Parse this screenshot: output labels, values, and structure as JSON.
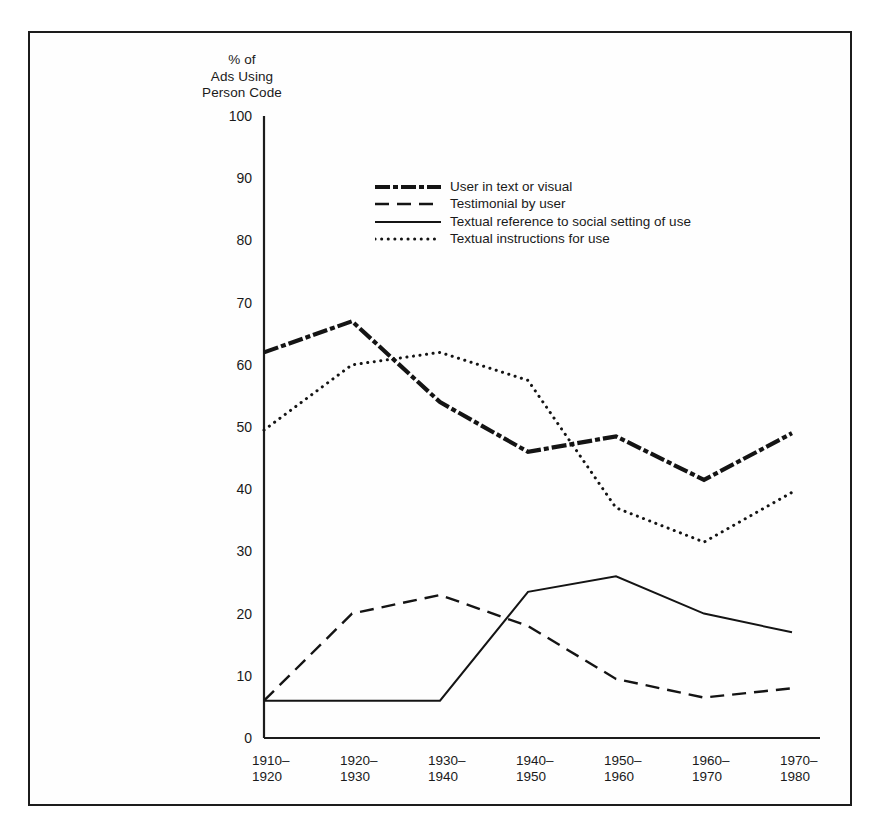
{
  "figure": {
    "y_axis_title": "% of\nAds Using\nPerson Code"
  },
  "legend": {
    "items": [
      {
        "label": "User in text or visual",
        "style": "thick-dash-dot"
      },
      {
        "label": "Testimonial by user",
        "style": "dashed"
      },
      {
        "label": "Textual reference to social setting of use",
        "style": "solid"
      },
      {
        "label": "Textual instructions for use",
        "style": "dotted"
      }
    ]
  },
  "chart_data": {
    "type": "line",
    "title": "",
    "xlabel": "",
    "ylabel": "% of Ads Using Person Code",
    "ylim": [
      0,
      100
    ],
    "ytick_values": [
      0,
      10,
      20,
      30,
      40,
      50,
      60,
      70,
      80,
      90,
      100
    ],
    "ytick_labels": [
      "0",
      "10",
      "20",
      "30",
      "40",
      "50",
      "60",
      "70",
      "80",
      "90",
      "100"
    ],
    "grid": false,
    "legend_position": "upper-center",
    "categories": [
      "1910-1920",
      "1920-1930",
      "1930-1940",
      "1940-1950",
      "1950-1960",
      "1960-1970",
      "1970-1980"
    ],
    "xtick_labels": [
      "1910–\n1920",
      "1920–\n1930",
      "1930–\n1940",
      "1940–\n1950",
      "1950–\n1960",
      "1960–\n1970",
      "1970–\n1980"
    ],
    "series": [
      {
        "name": "User in text or visual",
        "style": "thick-dash-dot",
        "color": "#141414",
        "values": [
          62,
          67,
          54,
          46,
          48.5,
          41.5,
          49
        ]
      },
      {
        "name": "Testimonial by user",
        "style": "dashed",
        "color": "#141414",
        "values": [
          6,
          20,
          23,
          18,
          9.5,
          6.5,
          8
        ]
      },
      {
        "name": "Textual reference to social setting of use",
        "style": "solid",
        "color": "#141414",
        "values": [
          6,
          6,
          6,
          23.5,
          26,
          20,
          17
        ]
      },
      {
        "name": "Textual instructions for use",
        "style": "dotted",
        "color": "#141414",
        "values": [
          49.5,
          60,
          62,
          57.5,
          37,
          31.5,
          39.5
        ]
      }
    ]
  }
}
